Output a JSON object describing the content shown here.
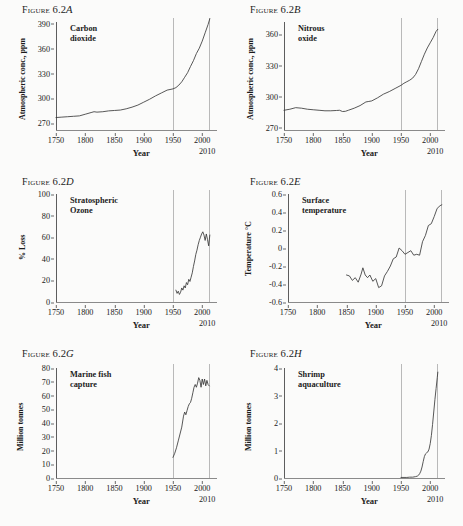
{
  "figure": {
    "word": "Figure",
    "number": "6.2"
  },
  "common": {
    "xlabel": "Year",
    "end_label": "2010",
    "xticks": [
      "1750",
      "1800",
      "1850",
      "1900",
      "1950",
      "2000"
    ],
    "xtick_values": [
      1750,
      1800,
      1850,
      1900,
      1950,
      2000
    ],
    "xmin": 1750,
    "xmax": 2015,
    "reference_lines": [
      1950,
      2012
    ]
  },
  "chart_data": [
    {
      "id": "A",
      "letter": "A",
      "type": "line",
      "title": "Carbon\ndioxide",
      "ylabel": "Atmospheric conc., ppm",
      "xlabel": "Year",
      "yticks": [
        "270",
        "300",
        "330",
        "360",
        "390"
      ],
      "ytick_values": [
        270,
        300,
        330,
        360,
        390
      ],
      "ylim": [
        262,
        392
      ],
      "xlim": [
        1750,
        2015
      ],
      "grid": false,
      "x": [
        1750,
        1760,
        1770,
        1780,
        1790,
        1800,
        1810,
        1815,
        1820,
        1830,
        1840,
        1850,
        1860,
        1870,
        1880,
        1890,
        1900,
        1910,
        1920,
        1930,
        1940,
        1950,
        1955,
        1960,
        1965,
        1970,
        1975,
        1980,
        1985,
        1990,
        1995,
        2000,
        2005,
        2010,
        2013
      ],
      "values": [
        277,
        277.5,
        278,
        278.5,
        279,
        281,
        283,
        284,
        283.5,
        284,
        285,
        285.5,
        286,
        287.5,
        289.5,
        292,
        295.5,
        299,
        303,
        306.5,
        310,
        311.5,
        313,
        316,
        320,
        325.5,
        331,
        338.5,
        345.5,
        354,
        360.5,
        369,
        379,
        389,
        396
      ]
    },
    {
      "id": "B",
      "letter": "B",
      "type": "line",
      "title": "Nitrous\noxide",
      "ylabel": "Atmospheric conc., ppm",
      "xlabel": "Year",
      "yticks": [
        "270",
        "300",
        "330",
        "360"
      ],
      "ytick_values": [
        270,
        300,
        330,
        360
      ],
      "ylim": [
        268,
        372
      ],
      "xlim": [
        1750,
        2015
      ],
      "grid": false,
      "x": [
        1750,
        1760,
        1770,
        1780,
        1790,
        1800,
        1810,
        1820,
        1830,
        1840,
        1845,
        1850,
        1855,
        1860,
        1870,
        1880,
        1890,
        1895,
        1900,
        1910,
        1920,
        1930,
        1940,
        1950,
        1955,
        1960,
        1965,
        1970,
        1975,
        1980,
        1985,
        1990,
        1995,
        2000,
        2005,
        2010,
        2013
      ],
      "values": [
        287,
        288,
        289.5,
        289,
        288,
        287.5,
        287,
        286.5,
        286.5,
        286.8,
        287,
        285.8,
        286,
        287,
        289,
        291.5,
        295,
        295.5,
        296,
        299,
        302.5,
        305,
        308,
        311,
        313,
        314.5,
        316,
        318,
        321.5,
        327,
        334,
        341,
        347,
        352,
        357,
        363,
        365
      ]
    },
    {
      "id": "D",
      "letter": "D",
      "type": "line",
      "title": "Stratospheric\nOzone",
      "ylabel": "% Loss",
      "xlabel": "Year",
      "yticks": [
        "0",
        "20",
        "40",
        "60",
        "80",
        "100"
      ],
      "ytick_values": [
        0,
        20,
        40,
        60,
        80,
        100
      ],
      "ylim": [
        0,
        100
      ],
      "xlim": [
        1750,
        2015
      ],
      "grid": false,
      "x": [
        1955,
        1957,
        1959,
        1961,
        1963,
        1965,
        1967,
        1969,
        1971,
        1973,
        1975,
        1977,
        1979,
        1981,
        1983,
        1985,
        1987,
        1989,
        1991,
        1993,
        1995,
        1997,
        1999,
        2001,
        2003,
        2005,
        2007,
        2009,
        2011,
        2013
      ],
      "values": [
        11,
        8,
        10,
        7,
        9,
        13,
        11,
        15,
        13,
        18,
        16,
        21,
        19,
        23,
        27,
        33,
        38,
        44,
        48,
        53,
        57,
        60,
        63,
        65,
        62,
        57,
        63,
        58,
        52,
        62
      ]
    },
    {
      "id": "E",
      "letter": "E",
      "type": "line",
      "title": "Surface\ntemperature",
      "ylabel": "Temperature °C",
      "xlabel": "Year",
      "yticks": [
        "-0.6",
        "-0.4",
        "-0.2",
        "0",
        "0.2",
        "0.4",
        "0.6"
      ],
      "ytick_values": [
        -0.6,
        -0.4,
        -0.2,
        0,
        0.2,
        0.4,
        0.6
      ],
      "ylim": [
        -0.6,
        0.6
      ],
      "xlim": [
        1750,
        2015
      ],
      "grid": false,
      "x": [
        1850,
        1855,
        1860,
        1865,
        1870,
        1875,
        1878,
        1882,
        1886,
        1890,
        1895,
        1900,
        1905,
        1910,
        1915,
        1920,
        1925,
        1930,
        1935,
        1940,
        1945,
        1950,
        1955,
        1960,
        1965,
        1970,
        1975,
        1980,
        1985,
        1990,
        1995,
        2000,
        2005,
        2010,
        2013
      ],
      "values": [
        -0.3,
        -0.31,
        -0.36,
        -0.33,
        -0.38,
        -0.29,
        -0.22,
        -0.3,
        -0.33,
        -0.3,
        -0.37,
        -0.34,
        -0.44,
        -0.42,
        -0.31,
        -0.26,
        -0.2,
        -0.12,
        -0.1,
        0.0,
        -0.03,
        -0.07,
        -0.05,
        -0.03,
        -0.08,
        -0.07,
        -0.08,
        0.07,
        0.14,
        0.25,
        0.27,
        0.35,
        0.44,
        0.47,
        0.48
      ]
    },
    {
      "id": "G",
      "letter": "G",
      "type": "line",
      "title": "Marine fish\ncapture",
      "ylabel": "Million tonnes",
      "xlabel": "Year",
      "yticks": [
        "0",
        "10",
        "20",
        "30",
        "40",
        "50",
        "60",
        "70",
        "80"
      ],
      "ytick_values": [
        0,
        10,
        20,
        30,
        40,
        50,
        60,
        70,
        80
      ],
      "ylim": [
        0,
        80
      ],
      "xlim": [
        1750,
        2015
      ],
      "grid": false,
      "x": [
        1950,
        1953,
        1956,
        1959,
        1962,
        1965,
        1968,
        1970,
        1972,
        1974,
        1976,
        1978,
        1980,
        1982,
        1984,
        1986,
        1988,
        1990,
        1992,
        1994,
        1996,
        1998,
        2000,
        2002,
        2004,
        2006,
        2008,
        2010,
        2012
      ],
      "values": [
        15,
        18,
        22,
        27,
        32,
        37,
        45,
        48,
        46,
        49,
        52,
        54,
        55,
        58,
        62,
        66,
        68,
        66,
        69,
        73,
        71,
        66,
        72,
        68,
        72,
        67,
        71,
        68,
        67
      ]
    },
    {
      "id": "H",
      "letter": "H",
      "type": "line",
      "title": "Shrimp\naquaculture",
      "ylabel": "Million tonnes",
      "xlabel": "Year",
      "yticks": [
        "0",
        "1",
        "2",
        "3",
        "4"
      ],
      "ytick_values": [
        0,
        1,
        2,
        3,
        4
      ],
      "ylim": [
        0,
        4
      ],
      "xlim": [
        1750,
        2015
      ],
      "grid": false,
      "x": [
        1950,
        1960,
        1965,
        1970,
        1975,
        1978,
        1980,
        1982,
        1984,
        1986,
        1988,
        1990,
        1992,
        1994,
        1996,
        1998,
        2000,
        2002,
        2004,
        2006,
        2008,
        2010,
        2012,
        2013
      ],
      "values": [
        0.02,
        0.02,
        0.03,
        0.03,
        0.05,
        0.07,
        0.1,
        0.16,
        0.25,
        0.4,
        0.6,
        0.78,
        0.88,
        0.92,
        0.95,
        1.05,
        1.25,
        1.55,
        1.95,
        2.4,
        2.85,
        3.25,
        3.65,
        3.85
      ]
    }
  ]
}
